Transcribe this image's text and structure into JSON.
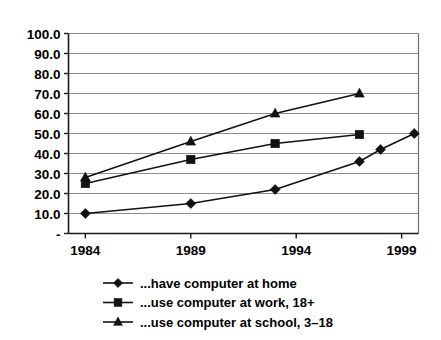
{
  "chart_data": {
    "type": "line",
    "title": "",
    "subtitle": "",
    "xlabel": "",
    "ylabel": "",
    "xlim": [
      1983.2,
      1999.8
    ],
    "ylim": [
      0,
      100
    ],
    "grid": true,
    "legend_position": "bottom",
    "x_ticks": [
      "1984",
      "1989",
      "1994",
      "1999"
    ],
    "x_tick_values": [
      1984,
      1989,
      1994,
      1999
    ],
    "y_ticks": [
      "-",
      "10.0",
      "20.0",
      "30.0",
      "40.0",
      "50.0",
      "60.0",
      "70.0",
      "80.0",
      "90.0",
      "100.0"
    ],
    "y_tick_values": [
      0,
      10,
      20,
      30,
      40,
      50,
      60,
      70,
      80,
      90,
      100
    ],
    "series": [
      {
        "name": "...have computer at home",
        "marker": "diamond",
        "color": "#111111",
        "x": [
          1984,
          1989,
          1993,
          1997,
          1998,
          1999.6
        ],
        "values": [
          10,
          15,
          22,
          36,
          42,
          50
        ]
      },
      {
        "name": "...use computer at work, 18+",
        "marker": "square",
        "color": "#111111",
        "x": [
          1984,
          1989,
          1993,
          1997
        ],
        "values": [
          25,
          37,
          45,
          49.5
        ]
      },
      {
        "name": "...use computer at school, 3–18",
        "marker": "triangle",
        "color": "#111111",
        "x": [
          1984,
          1989,
          1993,
          1997
        ],
        "values": [
          28,
          46,
          60,
          70
        ]
      }
    ]
  },
  "legend": {
    "items": [
      {
        "label": "...have computer at home",
        "marker": "diamond"
      },
      {
        "label": "...use computer at work, 18+",
        "marker": "square"
      },
      {
        "label": "...use computer at school, 3–18",
        "marker": "triangle"
      }
    ]
  }
}
